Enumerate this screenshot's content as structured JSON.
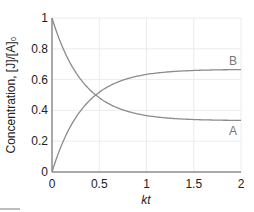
{
  "chart_data": {
    "type": "line",
    "title": "",
    "xlabel": "kt",
    "ylabel": "Concentration, [J]/[A]₀",
    "xlim": [
      0,
      2
    ],
    "ylim": [
      0,
      1
    ],
    "grid": true,
    "x_ticks": [
      0,
      0.5,
      1,
      1.5,
      2
    ],
    "x_tick_labels": [
      "0",
      "0.5",
      "1",
      "1.5",
      "2"
    ],
    "y_ticks": [
      0,
      0.2,
      0.4,
      0.6,
      0.8,
      1
    ],
    "y_tick_labels": [
      "0",
      "0.2",
      "0.4",
      "0.6",
      "0.8",
      "1"
    ],
    "legend": "inline labels at right end of curves",
    "x": [
      0,
      0.1,
      0.2,
      0.3,
      0.4,
      0.5,
      0.6,
      0.7,
      0.8,
      0.9,
      1.0,
      1.2,
      1.4,
      1.6,
      1.8,
      2.0
    ],
    "series": [
      {
        "name": "A",
        "values": [
          1.0,
          0.827,
          0.699,
          0.605,
          0.535,
          0.482,
          0.444,
          0.415,
          0.394,
          0.378,
          0.366,
          0.352,
          0.343,
          0.339,
          0.336,
          0.335
        ]
      },
      {
        "name": "B",
        "values": [
          0.0,
          0.173,
          0.301,
          0.395,
          0.465,
          0.518,
          0.556,
          0.585,
          0.606,
          0.622,
          0.634,
          0.648,
          0.657,
          0.661,
          0.664,
          0.665
        ]
      }
    ],
    "annotations": [
      "A",
      "B"
    ]
  },
  "labels": {
    "xlabel": "kt",
    "ylabel": "Concentration, [J]/[A]₀",
    "series_a": "A",
    "series_b": "B"
  },
  "colors": {
    "curve": "#8c8c8c",
    "axis": "#8c8c8c",
    "grid": "#ececec",
    "text": "#222222",
    "series_label": "#777777"
  }
}
